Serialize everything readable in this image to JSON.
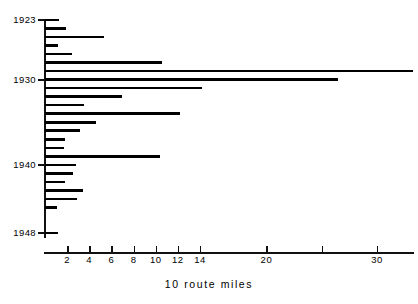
{
  "chart_data": {
    "type": "bar",
    "orientation": "horizontal",
    "title": "",
    "xlabel": "10 route miles",
    "ylabel": "",
    "xlim": [
      0,
      33.8
    ],
    "ylim": [
      1922.5,
      1948.5
    ],
    "grid": false,
    "legend": null,
    "x_ticks": [
      2,
      4,
      6,
      8,
      10,
      12,
      14,
      20,
      30
    ],
    "x_tick_labels": [
      "2",
      "4",
      "6",
      "8",
      "10",
      "12",
      "14",
      "20",
      "30"
    ],
    "x_minor_ticks": [
      25
    ],
    "y_ticks": [
      1923,
      1930,
      1940,
      1948
    ],
    "y_tick_labels": [
      "1923",
      "1930",
      "1940",
      "1948"
    ],
    "categories": [
      1923,
      1924,
      1925,
      1926,
      1927,
      1928,
      1929,
      1930,
      1931,
      1932,
      1933,
      1934,
      1935,
      1936,
      1937,
      1938,
      1939,
      1940,
      1941,
      1942,
      1943,
      1944,
      1945,
      1946,
      1947,
      1948
    ],
    "values": [
      1.3,
      1.9,
      5.3,
      1.2,
      2.4,
      10.6,
      33.2,
      26.5,
      14.2,
      7.0,
      3.5,
      12.2,
      4.6,
      3.2,
      1.8,
      1.7,
      10.4,
      2.8,
      2.5,
      1.8,
      3.4,
      2.9,
      1.1,
      0,
      0,
      1.2
    ]
  },
  "axis": {
    "x_title": "10 route miles"
  }
}
